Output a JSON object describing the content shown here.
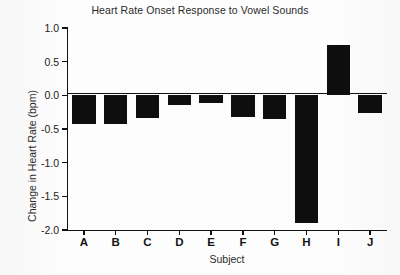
{
  "chart_data": {
    "type": "bar",
    "title": "Heart Rate Onset Response to Vowel Sounds",
    "xlabel": "Subject",
    "ylabel": "Change in Heart Rate (bpm)",
    "categories": [
      "A",
      "B",
      "C",
      "D",
      "E",
      "F",
      "G",
      "H",
      "I",
      "J"
    ],
    "values": [
      -0.42,
      -0.42,
      -0.33,
      -0.14,
      -0.11,
      -0.32,
      -0.35,
      -1.9,
      0.75,
      -0.26
    ],
    "ylim": [
      -2.0,
      1.0
    ],
    "yticks": [
      1.0,
      0.5,
      0.0,
      -0.5,
      -1.0,
      -1.5,
      -2.0
    ],
    "ytick_labels": [
      "1.0",
      "0.5",
      "0.0",
      "-0.5",
      "-1.0",
      "-1.5",
      "-2.0"
    ],
    "grid": false,
    "legend": null,
    "bar_color": "#0e0e0e",
    "axis_color": "#111111",
    "background_color": "#ffffff"
  }
}
